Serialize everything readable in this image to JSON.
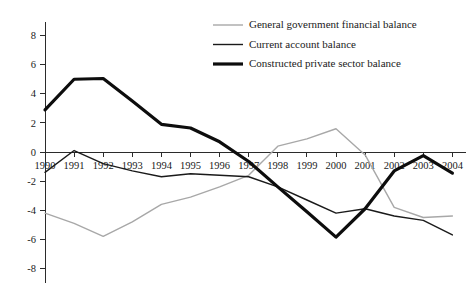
{
  "chart": {
    "title": "",
    "subtitle": "",
    "xlabel": "",
    "ylabel": ""
  },
  "axes": {
    "y_ticks": [
      "8",
      "6",
      "4",
      "2",
      "0",
      "-2",
      "-4",
      "-6",
      "-8"
    ],
    "x_ticks": [
      "1990",
      "1991",
      "1992",
      "1993",
      "1994",
      "1995",
      "1996",
      "1997",
      "1998",
      "1999",
      "2000",
      "2001",
      "2002",
      "2003",
      "2004"
    ],
    "y_min": -8,
    "y_max": 8,
    "grid": "off",
    "zero_line": "on"
  },
  "legend": {
    "position": "top-right",
    "items": [
      {
        "label": "General government financial balance",
        "color": "#a8a8a8",
        "width": 1.4,
        "swatch": "line-swatch-government"
      },
      {
        "label": "Current account balance",
        "color": "#1a1a1a",
        "width": 1.4,
        "swatch": "line-swatch-current-account"
      },
      {
        "label": "Constructed private sector balance",
        "color": "#0d0d0d",
        "width": 3.2,
        "swatch": "line-swatch-private-sector"
      }
    ]
  },
  "colors": {
    "government": "#a8a8a8",
    "current_account": "#1a1a1a",
    "private_sector": "#0d0d0d",
    "axis": "#2b2b2b",
    "background": "#ffffff"
  },
  "chart_data": {
    "type": "line",
    "title": "",
    "xlabel": "",
    "ylabel": "",
    "ylim": [
      -8,
      8
    ],
    "xlim": [
      "1990",
      "2004"
    ],
    "grid": false,
    "legend_position": "top-right",
    "categories": [
      "1990",
      "1991",
      "1992",
      "1993",
      "1994",
      "1995",
      "1996",
      "1997",
      "1998",
      "1999",
      "2000",
      "2001",
      "2002",
      "2003",
      "2004"
    ],
    "series": [
      {
        "name": "General government financial balance",
        "color": "#a8a8a8",
        "values": [
          -4.2,
          -4.9,
          -5.8,
          -4.8,
          -3.6,
          -3.1,
          -2.4,
          -1.6,
          0.4,
          0.9,
          1.6,
          -0.2,
          -3.8,
          -4.5,
          -4.4
        ]
      },
      {
        "name": "Current account balance",
        "color": "#1a1a1a",
        "values": [
          -1.4,
          0.1,
          -0.8,
          -1.3,
          -1.7,
          -1.5,
          -1.6,
          -1.7,
          -2.4,
          -3.3,
          -4.2,
          -3.9,
          -4.4,
          -4.7,
          -5.7
        ]
      },
      {
        "name": "Constructed private sector balance",
        "color": "#0d0d0d",
        "values": [
          2.9,
          5.0,
          5.05,
          3.5,
          1.9,
          1.65,
          0.7,
          -0.65,
          -2.4,
          -4.1,
          -5.85,
          -3.9,
          -1.3,
          -0.25,
          -1.45
        ]
      }
    ]
  }
}
